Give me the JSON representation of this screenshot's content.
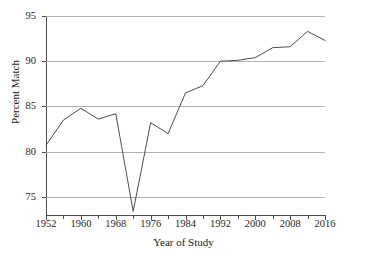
{
  "chart_data": {
    "type": "line",
    "title": "",
    "xlabel": "Year of Study",
    "ylabel": "Percent Match",
    "xlim": [
      1952,
      2016
    ],
    "ylim": [
      73.0,
      95.0
    ],
    "grid": true,
    "legend": false,
    "line_color": "#4d4d4d",
    "grid_color": "#b0b0b0",
    "x_tick_labels": [
      "1952",
      "1960",
      "1968",
      "1976",
      "1984",
      "1992",
      "2000",
      "2008",
      "2016"
    ],
    "x_tick_values": [
      1952,
      1960,
      1968,
      1976,
      1984,
      1992,
      2000,
      2008,
      2016
    ],
    "x_minor_ticks": [
      1956,
      1964,
      1972,
      1980,
      1988,
      1996,
      2004,
      2012
    ],
    "y_tick_labels": [
      "75",
      "80",
      "85",
      "90",
      "95"
    ],
    "y_tick_values": [
      75,
      80,
      85,
      90,
      95
    ],
    "x": [
      1952,
      1956,
      1960,
      1964,
      1968,
      1972,
      1976,
      1980,
      1984,
      1988,
      1992,
      1996,
      2000,
      2004,
      2008,
      2012,
      2016
    ],
    "values": [
      80.7,
      83.5,
      84.8,
      83.6,
      84.2,
      73.4,
      83.2,
      82.0,
      86.5,
      87.3,
      90.0,
      90.1,
      90.4,
      91.5,
      91.6,
      93.3,
      92.3
    ],
    "series": [
      {
        "name": "Percent Match",
        "values": [
          80.7,
          83.5,
          84.8,
          83.6,
          84.2,
          73.4,
          83.2,
          82.0,
          86.5,
          87.3,
          90.0,
          90.1,
          90.4,
          91.5,
          91.6,
          93.3,
          92.3
        ]
      }
    ]
  }
}
